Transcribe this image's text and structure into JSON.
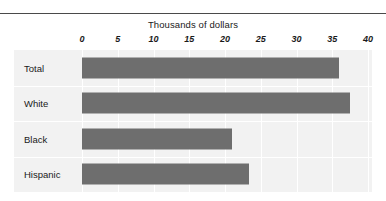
{
  "chart_data": {
    "type": "bar",
    "orientation": "horizontal",
    "title": "Thousands of dollars",
    "xlabel": "",
    "ylabel": "",
    "categories": [
      "Total",
      "White",
      "Black",
      "Hispanic"
    ],
    "values": [
      36,
      37.5,
      21,
      23.4
    ],
    "xlim": [
      0,
      40
    ],
    "xticks": [
      0,
      5,
      10,
      15,
      20,
      25,
      30,
      35,
      40
    ],
    "xticklabels": [
      "0",
      "5",
      "10",
      "15",
      "20",
      "25",
      "30",
      "35",
      "40"
    ],
    "grid": true,
    "grid_axis": "x",
    "legend": false,
    "bar_color": "#6e6e6e",
    "plot_background": "#f2f2f2",
    "gridline_color": "#ffffff"
  },
  "figure": {
    "top_rule_color": "#4a4a4a"
  }
}
